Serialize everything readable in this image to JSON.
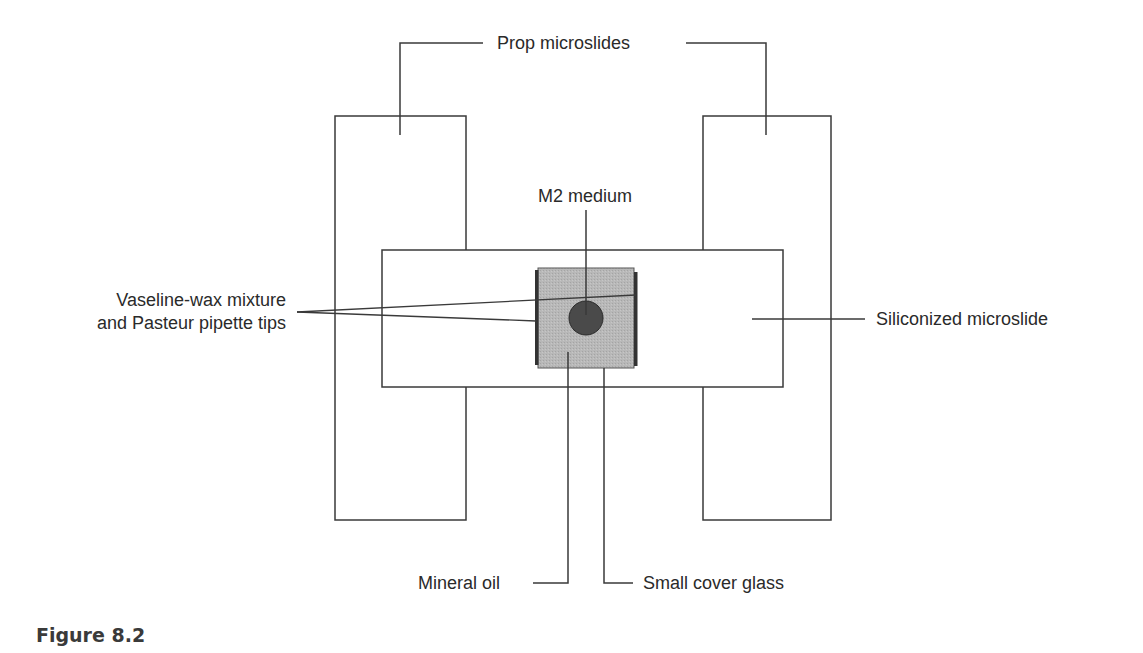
{
  "figure": {
    "caption": "Figure 8.2"
  },
  "labels": {
    "prop_microslides": "Prop microslides",
    "m2_medium": "M2 medium",
    "vaseline_line1": "Vaseline-wax mixture",
    "vaseline_line2": "and Pasteur pipette tips",
    "siliconized_microslide": "Siliconized microslide",
    "mineral_oil": "Mineral oil",
    "small_cover_glass": "Small cover glass"
  },
  "colors": {
    "line": "#3a3a3a",
    "cover_glass_fill": "#b4b4b4",
    "medium_drop": "#4a4a4a",
    "wax_strip": "#333333",
    "background": "#ffffff"
  }
}
